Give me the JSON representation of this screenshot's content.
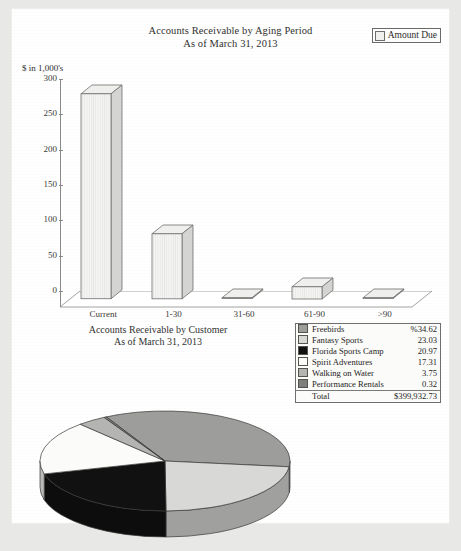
{
  "document": {
    "type": "scanned-financial-report-page"
  },
  "bar_chart": {
    "title_line1": "Accounts Receivable by Aging Period",
    "title_line2": "As of March 31, 2013",
    "axis_unit_label": "$ in 1,000's",
    "legend": {
      "label": "Amount Due",
      "swatch_color": "#f0f0ee"
    }
  },
  "pie_chart": {
    "title_line1": "Accounts Receivable by Customer",
    "title_line2": "As of March 31, 2013"
  },
  "legend_table": {
    "rows": [
      {
        "name": "Freebirds",
        "value": "%34.62",
        "color": "#9d9d9b"
      },
      {
        "name": "Fantasy Sports",
        "value": "23.03",
        "color": "#d8d8d6"
      },
      {
        "name": "Florida Sports Camp",
        "value": "20.97",
        "color": "#111111"
      },
      {
        "name": "Spirit Adventures",
        "value": "17.31",
        "color": "#fbfbfa"
      },
      {
        "name": "Walking on Water",
        "value": "3.75",
        "color": "#b4b4b2"
      },
      {
        "name": "Performance Rentals",
        "value": "0.32",
        "color": "#7e7e7c"
      }
    ],
    "total_label": "Total",
    "total_value": "$399,932.73"
  },
  "chart_data": [
    {
      "type": "bar",
      "title": "Accounts Receivable by Aging Period\nAs of March 31, 2013",
      "xlabel": "",
      "ylabel": "$ in 1,000's",
      "categories": [
        "Current",
        "1-30",
        "31-60",
        "61-90",
        ">90"
      ],
      "values": [
        290,
        92,
        0.6,
        17.3,
        0.3
      ],
      "series": [
        {
          "name": "Amount Due",
          "values": [
            290,
            92,
            0.6,
            17.3,
            0.3
          ]
        }
      ],
      "ylim": [
        0,
        300
      ],
      "yticks": [
        0,
        50,
        100,
        150,
        200,
        250,
        300
      ],
      "ytick_labels": [
        "0",
        "50",
        "100",
        "150",
        "200",
        "250",
        "300"
      ],
      "grid": false,
      "legend_position": "top-right",
      "style": "3d-column"
    },
    {
      "type": "pie",
      "title": "Accounts Receivable by Customer\nAs of March 31, 2013",
      "labels": [
        "Freebirds",
        "Fantasy Sports",
        "Florida Sports Camp",
        "Spirit Adventures",
        "Walking on Water",
        "Performance Rentals"
      ],
      "values": [
        34.62,
        23.03,
        20.97,
        17.31,
        3.75,
        0.32
      ],
      "unit": "percent",
      "total_label": "Total",
      "total_value": "$399,932.73",
      "colors": [
        "#9d9d9b",
        "#d8d8d6",
        "#111111",
        "#fbfbfa",
        "#b4b4b2",
        "#7e7e7c"
      ],
      "legend_position": "right",
      "style": "3d-pie"
    }
  ]
}
